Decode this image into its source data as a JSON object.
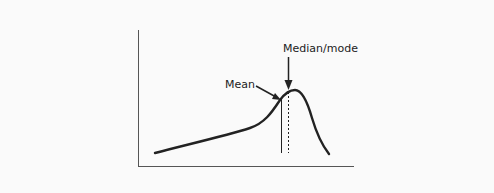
{
  "diagram": {
    "type": "distribution-curve",
    "labels": {
      "mean": "Mean",
      "median_mode": "Median/mode"
    },
    "colors": {
      "background": "#fafafa",
      "stroke": "#222222",
      "axis": "#555555"
    }
  }
}
